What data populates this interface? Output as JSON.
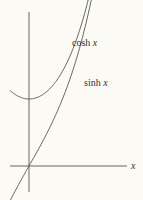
{
  "chart_data": {
    "type": "line",
    "title": "",
    "xlabel": "x",
    "ylabel": "",
    "xlim": [
      -0.5,
      2.6
    ],
    "ylim": [
      -0.7,
      3.9
    ],
    "series": [
      {
        "name": "cosh x",
        "label_text": "cosh",
        "label_var": "x",
        "function": "cosh",
        "x_range": [
          -0.5,
          2.35
        ]
      },
      {
        "name": "sinh x",
        "label_text": "sinh",
        "label_var": "x",
        "function": "sinh",
        "x_range": [
          -0.5,
          2.55
        ]
      }
    ],
    "grid": false,
    "legend": "inline labels"
  }
}
